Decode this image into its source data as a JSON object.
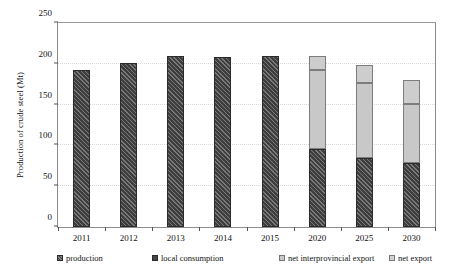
{
  "chart_data": {
    "type": "bar",
    "title": "",
    "xlabel": "",
    "ylabel": "Production of crude steel (Mt)",
    "ylim": [
      0,
      250
    ],
    "yticks": [
      0,
      50,
      100,
      150,
      200,
      250
    ],
    "ytick_labels": [
      "0",
      "50",
      "100",
      "150",
      "200",
      "250"
    ],
    "grid": true,
    "legend_position": "bottom",
    "stacked": true,
    "categories": [
      "2011",
      "2012",
      "2013",
      "2014",
      "2015",
      "2020",
      "2025",
      "2030"
    ],
    "series": [
      {
        "name": "production",
        "values": [
          193,
          201,
          209,
          208,
          209,
          null,
          null,
          null
        ]
      },
      {
        "name": "local consumption",
        "values": [
          null,
          null,
          null,
          null,
          null,
          95,
          84,
          78
        ]
      },
      {
        "name": "net interprovincial export",
        "values": [
          null,
          null,
          null,
          null,
          null,
          98,
          92,
          73
        ]
      },
      {
        "name": "net export",
        "values": [
          null,
          null,
          null,
          null,
          null,
          16,
          22,
          29
        ]
      }
    ],
    "bar_totals": [
      193,
      201,
      209,
      208,
      209,
      209,
      198,
      180
    ],
    "legend": [
      {
        "label": "production",
        "color": "#3e3e3e",
        "pattern": "hatch"
      },
      {
        "label": "local consumption",
        "color": "#454545",
        "pattern": "solid"
      },
      {
        "label": "net interprovincial export",
        "color": "#c8c8c8",
        "pattern": "solid"
      },
      {
        "label": "net export",
        "color": "#d2d2d2",
        "pattern": "solid"
      }
    ]
  }
}
